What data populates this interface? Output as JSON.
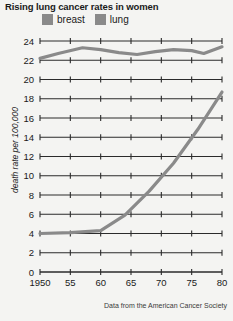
{
  "chart_data": {
    "type": "line",
    "title": "Rising lung cancer rates in women",
    "xlabel": "",
    "ylabel": "death rate per 100,000",
    "source_note": "Data from the American Cancer Society",
    "grid": true,
    "legend_position": "top",
    "xlim": [
      1950,
      1980
    ],
    "ylim": [
      0,
      24
    ],
    "x_tick_labels": [
      "1950",
      "55",
      "60",
      "65",
      "70",
      "75",
      "80"
    ],
    "x_ticks": [
      1950,
      1955,
      1960,
      1965,
      1970,
      1975,
      1980
    ],
    "y_tick_labels": [
      "0",
      "2",
      "4",
      "6",
      "8",
      "10",
      "12",
      "14",
      "16",
      "18",
      "20",
      "22",
      "24"
    ],
    "y_ticks": [
      0,
      2,
      4,
      6,
      8,
      10,
      12,
      14,
      16,
      18,
      20,
      22,
      24
    ],
    "series": [
      {
        "name": "breast",
        "color": "#8a8a8a",
        "x": [
          1950,
          1953,
          1957,
          1960,
          1963,
          1966,
          1969,
          1972,
          1975,
          1977,
          1980
        ],
        "values": [
          22.2,
          22.7,
          23.3,
          23.1,
          22.8,
          22.6,
          22.9,
          23.1,
          23.0,
          22.7,
          23.4
        ]
      },
      {
        "name": "lung",
        "color": "#8a8a8a",
        "x": [
          1950,
          1955,
          1960,
          1964,
          1968,
          1972,
          1976,
          1980
        ],
        "values": [
          4.0,
          4.1,
          4.3,
          5.9,
          8.4,
          11.3,
          14.8,
          18.7
        ]
      }
    ]
  },
  "legend": {
    "items": [
      {
        "label": "breast",
        "color": "#8a8a8a"
      },
      {
        "label": "lung",
        "color": "#8a8a8a"
      }
    ]
  },
  "colors": {
    "background": "#f4f4f2",
    "axis": "#2b2b2b",
    "grid": "#2b2b2b",
    "line": "#8a8a8a",
    "text": "#1a1a1a"
  }
}
